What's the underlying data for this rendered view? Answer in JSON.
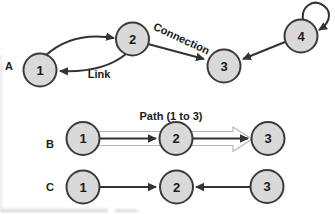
{
  "colors": {
    "background": "#ffffff",
    "node_fill": "#d9d9d9",
    "node_stroke": "#3b3b3b",
    "edge": "#333333",
    "text": "#1a1a1a",
    "hollow_arrow_outline": "#b5b5b5",
    "hollow_arrow_fill": "#ffffff"
  },
  "figure": {
    "rows": [
      {
        "label": "A",
        "nodes": [
          {
            "id": "1"
          },
          {
            "id": "2"
          },
          {
            "id": "3"
          },
          {
            "id": "4"
          }
        ],
        "edges": [
          {
            "from": "1",
            "to": "2",
            "style": "curved"
          },
          {
            "from": "2",
            "to": "1",
            "style": "curved",
            "label": "Link"
          },
          {
            "from": "2",
            "to": "3",
            "style": "straight",
            "label": "Connection"
          },
          {
            "from": "4",
            "to": "3",
            "style": "straight"
          },
          {
            "from": "4",
            "to": "4",
            "style": "self-loop"
          }
        ]
      },
      {
        "label": "B",
        "annotation": "Path (1 to 3)",
        "nodes": [
          {
            "id": "1"
          },
          {
            "id": "2"
          },
          {
            "id": "3"
          }
        ],
        "edges": [
          {
            "from": "1",
            "to": "2",
            "style": "straight"
          },
          {
            "from": "2",
            "to": "3",
            "style": "straight"
          },
          {
            "from": "1",
            "to": "3",
            "style": "hollow-path-arrow"
          }
        ]
      },
      {
        "label": "C",
        "nodes": [
          {
            "id": "1"
          },
          {
            "id": "2"
          },
          {
            "id": "3"
          }
        ],
        "edges": [
          {
            "from": "1",
            "to": "2",
            "style": "straight"
          },
          {
            "from": "3",
            "to": "2",
            "style": "straight"
          }
        ]
      }
    ]
  }
}
